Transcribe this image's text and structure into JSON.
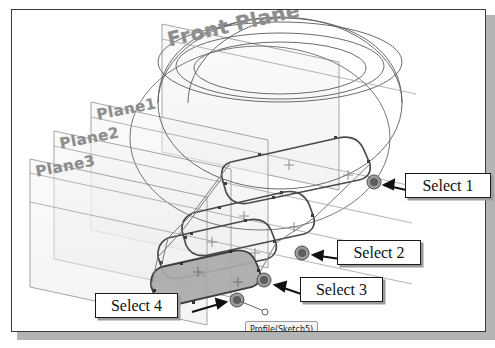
{
  "app": {
    "kind": "cad-viewport",
    "title": "SolidWorks reference plane selection illustration"
  },
  "viewport": {
    "background_color": "#ffffff",
    "frame_color": "#3a3a3a",
    "shadow_color": "#b4b4b4"
  },
  "plane_labels": [
    {
      "id": "front-plane",
      "text": "Front Plane",
      "color": "#8d8d8d",
      "rotation_deg": -13
    },
    {
      "id": "plane1",
      "text": "Plane1",
      "color": "#8d8d8d",
      "rotation_deg": -11
    },
    {
      "id": "plane2",
      "text": "Plane2",
      "color": "#8d8d8d",
      "rotation_deg": -11
    },
    {
      "id": "plane3",
      "text": "Plane3",
      "color": "#8d8d8d",
      "rotation_deg": -11
    }
  ],
  "callouts": [
    {
      "id": "select-1",
      "text": "Select 1",
      "points_to": "sketch-endpoint-top-right"
    },
    {
      "id": "select-2",
      "text": "Select 2",
      "points_to": "sketch-endpoint-middle"
    },
    {
      "id": "select-3",
      "text": "Select 3",
      "points_to": "sketch-endpoint-lower"
    },
    {
      "id": "select-4",
      "text": "Select 4",
      "points_to": "sketch-endpoint-bottom-left"
    }
  ],
  "tooltip": {
    "id": "profile-tooltip",
    "text": "Profile(Sketch5)",
    "background": "#f3f3f3",
    "border": "#9b9b9b"
  },
  "geometry": {
    "model": "lofted-sphere-with-four-sketch-profiles",
    "selection_markers": 4,
    "selection_marker_color": "#6b6b6b",
    "wireframe_color": "#555555",
    "plane_fill": "#f0f0f0",
    "shaded_profile_fill": "#a9a9a9",
    "sketch_line_color": "#4a4a4a"
  }
}
